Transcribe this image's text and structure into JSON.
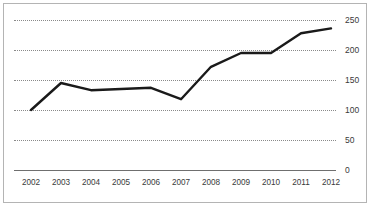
{
  "chart_data": {
    "type": "line",
    "title": "",
    "subtitle": "",
    "xlabel": "",
    "ylabel": "",
    "categories": [
      "2002",
      "2003",
      "2004",
      "2005",
      "2006",
      "2007",
      "2008",
      "2009",
      "2010",
      "2011",
      "2012"
    ],
    "values": [
      100,
      145,
      133,
      135,
      137,
      118,
      172,
      195,
      195,
      228,
      236
    ],
    "series": [
      {
        "name": "series-1",
        "values": [
          100,
          145,
          133,
          135,
          137,
          118,
          172,
          195,
          195,
          228,
          236
        ]
      }
    ],
    "ylim": [
      0,
      250
    ],
    "yticks": [
      0,
      50,
      100,
      150,
      200,
      250
    ],
    "ytick_labels": [
      "0",
      "50",
      "100",
      "150",
      "200",
      "250"
    ],
    "xtick_labels": [
      "2002",
      "2003",
      "2004",
      "2005",
      "2006",
      "2007",
      "2008",
      "2009",
      "2010",
      "2011",
      "2012"
    ],
    "grid": true,
    "grid_axis": "y",
    "grid_style": "dotted",
    "legend": false,
    "legend_position": "none",
    "line_color": "#1a1a1a",
    "grid_color": "#8a8a8a",
    "axis_color": "#6f6f6f",
    "background_color": "#ffffff",
    "border_color": "#b4b4b4",
    "annotations": []
  },
  "axes": {
    "y_labels": [
      {
        "value": "250"
      },
      {
        "value": "200"
      },
      {
        "value": "150"
      },
      {
        "value": "100"
      },
      {
        "value": "50"
      },
      {
        "value": "0"
      }
    ],
    "x_labels": [
      {
        "value": "2002"
      },
      {
        "value": "2003"
      },
      {
        "value": "2004"
      },
      {
        "value": "2005"
      },
      {
        "value": "2006"
      },
      {
        "value": "2007"
      },
      {
        "value": "2008"
      },
      {
        "value": "2009"
      },
      {
        "value": "2010"
      },
      {
        "value": "2011"
      },
      {
        "value": "2012"
      }
    ]
  }
}
